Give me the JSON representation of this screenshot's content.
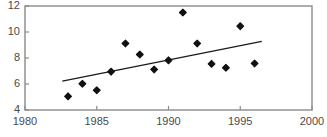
{
  "chart_data": {
    "type": "scatter",
    "title": "",
    "xlabel": "",
    "ylabel": "",
    "xlim": [
      1980,
      2000
    ],
    "ylim": [
      4,
      12
    ],
    "grid": false,
    "legend": null,
    "xticks": [
      1980,
      1985,
      1990,
      1995,
      2000
    ],
    "xtick_labels": [
      "1980",
      "1985",
      "1990",
      "1995",
      "2000"
    ],
    "yticks": [
      4,
      6,
      8,
      10,
      12
    ],
    "ytick_labels": [
      "4",
      "6",
      "8",
      "10",
      "12"
    ],
    "marker": "diamond",
    "marker_color": "#111111",
    "points": [
      {
        "x": 1983,
        "y": 5.05
      },
      {
        "x": 1984,
        "y": 6.02
      },
      {
        "x": 1985,
        "y": 5.52
      },
      {
        "x": 1986,
        "y": 6.95
      },
      {
        "x": 1987,
        "y": 9.12
      },
      {
        "x": 1988,
        "y": 8.27
      },
      {
        "x": 1989,
        "y": 7.12
      },
      {
        "x": 1990,
        "y": 7.82
      },
      {
        "x": 1991,
        "y": 11.5
      },
      {
        "x": 1992,
        "y": 9.12
      },
      {
        "x": 1993,
        "y": 7.55
      },
      {
        "x": 1994,
        "y": 7.25
      },
      {
        "x": 1995,
        "y": 10.45
      },
      {
        "x": 1996,
        "y": 7.58
      }
    ],
    "trendline": {
      "type": "line",
      "color": "#1a1a1a",
      "x_start": 1982.6,
      "y_start": 6.22,
      "x_end": 1996.5,
      "y_end": 9.28
    },
    "axis_color": "#8a8a8a",
    "frame": true
  }
}
